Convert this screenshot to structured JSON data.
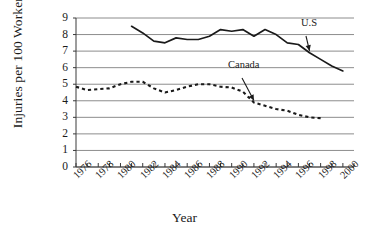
{
  "chart_data": {
    "type": "line",
    "title": "",
    "xlabel": "Year",
    "ylabel": "Injuries per 100 Workers",
    "xlim": [
      1976,
      2001
    ],
    "ylim": [
      0,
      9
    ],
    "grid": "horizontal",
    "legend_position": "inline-annotations",
    "y_ticks": [
      0,
      1,
      2,
      3,
      4,
      5,
      6,
      7,
      8,
      9
    ],
    "x_tick_labels": [
      "1976",
      "1978",
      "1980",
      "1982",
      "1984",
      "1986",
      "1988",
      "1990",
      "1992",
      "1994",
      "1996",
      "1998",
      "2000"
    ],
    "x_tick_label_values": [
      1976,
      1978,
      1980,
      1982,
      1984,
      1986,
      1988,
      1990,
      1992,
      1994,
      1996,
      1998,
      2000
    ],
    "x_minor_ticks": [
      1976,
      1977,
      1978,
      1979,
      1980,
      1981,
      1982,
      1983,
      1984,
      1985,
      1986,
      1987,
      1988,
      1989,
      1990,
      1991,
      1992,
      1993,
      1994,
      1995,
      1996,
      1997,
      1998,
      1999,
      2000,
      2001
    ],
    "series": [
      {
        "name": "U.S",
        "style": "solid",
        "color": "#1a1a1a",
        "x": [
          1981,
          1982,
          1983,
          1984,
          1985,
          1986,
          1987,
          1988,
          1989,
          1990,
          1991,
          1992,
          1993,
          1994,
          1995,
          1996,
          1997,
          1998,
          1999,
          2000
        ],
        "values": [
          8.5,
          8.1,
          7.6,
          7.5,
          7.8,
          7.7,
          7.7,
          7.9,
          8.3,
          8.2,
          8.3,
          7.9,
          8.3,
          8.0,
          7.5,
          7.4,
          6.9,
          6.5,
          6.1,
          5.8
        ],
        "annotation": {
          "label": "U.S",
          "points_to_x": 1997,
          "points_to_y": 6.9
        }
      },
      {
        "name": "Canada",
        "style": "dashed",
        "color": "#1a1a1a",
        "x": [
          1976,
          1977,
          1978,
          1979,
          1980,
          1981,
          1982,
          1983,
          1984,
          1985,
          1986,
          1987,
          1988,
          1989,
          1990,
          1991,
          1992,
          1993,
          1994,
          1995,
          1996,
          1997,
          1998
        ],
        "values": [
          4.85,
          4.65,
          4.7,
          4.75,
          5.0,
          5.15,
          5.15,
          4.75,
          4.5,
          4.65,
          4.85,
          5.0,
          5.0,
          4.85,
          4.8,
          4.55,
          3.9,
          3.7,
          3.5,
          3.4,
          3.15,
          3.0,
          2.95
        ],
        "annotation": {
          "label": "Canada",
          "points_to_x": 1992,
          "points_to_y": 3.9
        }
      }
    ]
  },
  "axis": {
    "ylabel": "Injuries per 100 Workers",
    "xlabel": "Year"
  }
}
